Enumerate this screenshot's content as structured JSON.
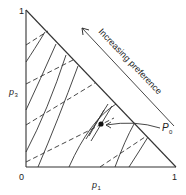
{
  "diagram": {
    "type": "probability-triangle-indifference-map",
    "labels": {
      "top_vertex": "1",
      "origin": "0",
      "right_vertex": "1",
      "y_axis": "p",
      "y_axis_sub": "3",
      "x_axis": "p",
      "x_axis_sub": "1",
      "point": "P",
      "point_sub": "0",
      "arrow_text": "Increasing preference"
    },
    "colors": {
      "ink": "#333333",
      "background": "#ffffff"
    },
    "legend": {
      "solid_lines": "indifference curves",
      "dashed_lines": "iso-expected-value lines"
    }
  }
}
